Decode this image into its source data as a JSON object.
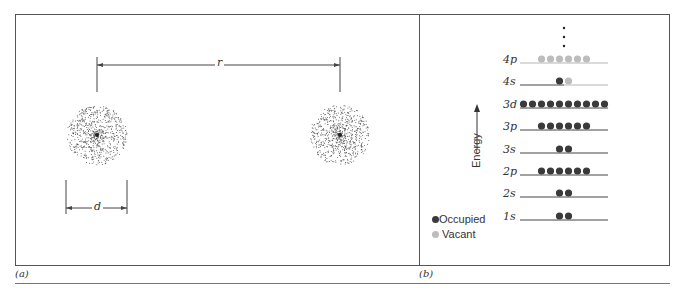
{
  "panels": {
    "a": {
      "tag": "(a)",
      "separation_label": "r",
      "diameter_label": "d",
      "atoms": [
        {
          "name": "left-atom",
          "cx": 97,
          "cy": 135,
          "radius": 30
        },
        {
          "name": "right-atom",
          "cx": 340,
          "cy": 135,
          "radius": 30
        }
      ]
    },
    "b": {
      "tag": "(b)",
      "axis_label": "Energy",
      "ellipsis": "⋮",
      "levels": [
        {
          "label": "4p",
          "y": 63,
          "occupied": 0,
          "vacant": 6
        },
        {
          "label": "4s",
          "y": 85,
          "occupied": 1,
          "vacant": 1
        },
        {
          "label": "3d",
          "y": 108,
          "occupied": 10,
          "vacant": 0
        },
        {
          "label": "3p",
          "y": 130,
          "occupied": 6,
          "vacant": 0
        },
        {
          "label": "3s",
          "y": 153,
          "occupied": 2,
          "vacant": 0
        },
        {
          "label": "2p",
          "y": 175,
          "occupied": 6,
          "vacant": 0
        },
        {
          "label": "2s",
          "y": 197,
          "occupied": 2,
          "vacant": 0
        },
        {
          "label": "1s",
          "y": 220,
          "occupied": 2,
          "vacant": 0
        }
      ],
      "legend": [
        {
          "label": "Occupied",
          "color": "#3a3a3a"
        },
        {
          "label": "Vacant",
          "color": "#bdbdbd"
        }
      ]
    }
  },
  "colors": {
    "occupied": "#3a3a3a",
    "vacant": "#bdbdbd",
    "line": "#444444",
    "vacant_line": "#b5b5b5",
    "border": "#555555"
  }
}
